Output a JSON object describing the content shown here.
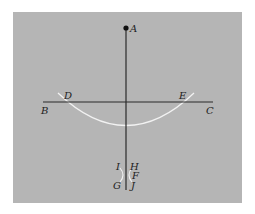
{
  "diagram": {
    "type": "geometric-construction",
    "colors": {
      "background": "#ffffff",
      "panel": "#b5b5b5",
      "line": "#2a2a2a",
      "arc": "#f2f2f2",
      "point": "#111111"
    },
    "labels": {
      "A": "A",
      "B": "B",
      "C": "C",
      "D": "D",
      "E": "E",
      "F": "F",
      "G": "G",
      "H": "H",
      "I": "I",
      "J": "J"
    },
    "points": [
      {
        "id": "A",
        "x": 126,
        "y": 28
      },
      {
        "id": "B",
        "x": 43,
        "y": 102
      },
      {
        "id": "C",
        "x": 213,
        "y": 102
      },
      {
        "id": "D",
        "x": 66,
        "y": 102
      },
      {
        "id": "E",
        "x": 186,
        "y": 102
      },
      {
        "id": "F",
        "x": 126,
        "y": 175
      }
    ]
  }
}
